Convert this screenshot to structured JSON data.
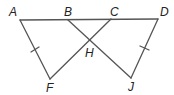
{
  "diagram": {
    "type": "geometry",
    "stroke_color": "#555555",
    "label_color": "#222222",
    "points": {
      "A": {
        "label": "A",
        "x": 20,
        "y": 20
      },
      "B": {
        "label": "B",
        "x": 68,
        "y": 20
      },
      "C": {
        "label": "C",
        "x": 111,
        "y": 19
      },
      "D": {
        "label": "D",
        "x": 158,
        "y": 19
      },
      "H": {
        "label": "H",
        "x": 90,
        "y": 40
      },
      "F": {
        "label": "F",
        "x": 50,
        "y": 79
      },
      "J": {
        "label": "J",
        "x": 131,
        "y": 78
      }
    },
    "segments": [
      {
        "from": "A",
        "to": "D"
      },
      {
        "from": "A",
        "to": "F"
      },
      {
        "from": "F",
        "to": "C"
      },
      {
        "from": "B",
        "to": "J"
      },
      {
        "from": "J",
        "to": "D"
      }
    ],
    "congruence_marks": [
      {
        "segment": "AF",
        "ticks": 1
      },
      {
        "segment": "DJ",
        "ticks": 1
      }
    ]
  }
}
